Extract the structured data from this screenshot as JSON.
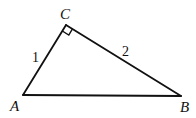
{
  "diagram": {
    "type": "right-triangle",
    "vertices": {
      "A": {
        "label": "A",
        "x": 23,
        "y": 95
      },
      "B": {
        "label": "B",
        "x": 181,
        "y": 96
      },
      "C": {
        "label": "C",
        "x": 66,
        "y": 25
      }
    },
    "right_angle_at": "C",
    "sides": {
      "AC": {
        "label": "1"
      },
      "CB": {
        "label": "2"
      },
      "AB": {
        "label": ""
      }
    },
    "colors": {
      "stroke": "#111111",
      "background": "#ffffff"
    }
  }
}
